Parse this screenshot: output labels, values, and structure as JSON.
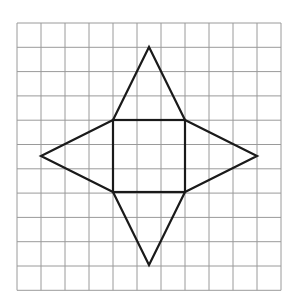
{
  "diagram": {
    "grid": {
      "columns": 11,
      "rows": 11,
      "origin_x": 17,
      "origin_y": 23,
      "cell_w": 24,
      "cell_h": 24.3,
      "line_color": "#9a9a9a"
    },
    "shape": {
      "stroke_color": "#1a1a1a",
      "square": {
        "x1": 113,
        "y1": 120,
        "x2": 185,
        "y2": 192
      },
      "triangles": [
        {
          "name": "top",
          "apex": [
            149,
            47
          ]
        },
        {
          "name": "bottom",
          "apex": [
            149,
            265
          ]
        },
        {
          "name": "left",
          "apex": [
            41,
            156
          ]
        },
        {
          "name": "right",
          "apex": [
            257,
            156
          ]
        }
      ]
    }
  }
}
